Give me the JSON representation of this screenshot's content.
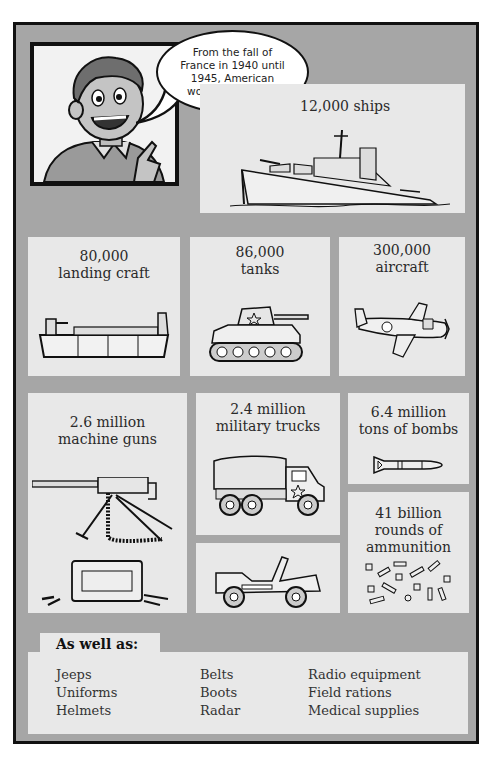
{
  "speech_bubble": {
    "text": "From the fall of\nFrance in 1940 until\n1945, American\nworkers produce:"
  },
  "panels": {
    "ships": {
      "label": "12,000 ships",
      "icon": "ship-icon"
    },
    "landing_craft": {
      "label": "80,000\nlanding craft",
      "icon": "landing-craft-icon"
    },
    "tanks": {
      "label": "86,000\ntanks",
      "icon": "tank-icon"
    },
    "aircraft": {
      "label": "300,000\naircraft",
      "icon": "aircraft-icon"
    },
    "machine_guns": {
      "label": "2.6 million\nmachine guns",
      "icon": "machine-gun-icon"
    },
    "trucks": {
      "label": "2.4 million\nmilitary trucks",
      "icon": "truck-icon"
    },
    "jeep": {
      "icon": "jeep-icon"
    },
    "bombs": {
      "label": "6.4 million\ntons of bombs",
      "icon": "bomb-icon"
    },
    "ammunition": {
      "label": "41 billion\nrounds of\nammunition",
      "icon": "ammunition-icon"
    }
  },
  "also": {
    "heading": "As well as:",
    "columns": [
      [
        "Jeeps",
        "Uniforms",
        "Helmets"
      ],
      [
        "Belts",
        "Boots",
        "Radar"
      ],
      [
        "Radio equipment",
        "Field rations",
        "Medical supplies"
      ]
    ]
  },
  "colors": {
    "frame_bg": "#a6a6a6",
    "panel_bg": "#e8e8e8",
    "border": "#111111",
    "text": "#2a2a2a"
  }
}
